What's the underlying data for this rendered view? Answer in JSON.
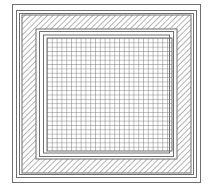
{
  "diagram": {
    "type": "nested-square-pattern",
    "colors": {
      "background": "#ffffff",
      "line": "#6e6e6e",
      "hatch": "#8a8a8a",
      "grid": "#707070"
    },
    "layers": [
      {
        "name": "outer-border",
        "style": "single-line"
      },
      {
        "name": "double-border",
        "style": "double-line"
      },
      {
        "name": "hatched-band",
        "style": "diagonal-hatch"
      },
      {
        "name": "inner-double-border",
        "style": "double-line"
      },
      {
        "name": "grid-core",
        "style": "square-grid",
        "divisions": 26
      }
    ]
  }
}
